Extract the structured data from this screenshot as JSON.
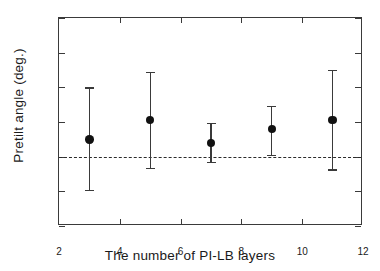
{
  "chart_data": {
    "type": "scatter",
    "title": "",
    "xlabel": "The number of PI-LB layers",
    "ylabel": "Pretilt angle (deg.)",
    "xlim": [
      2,
      12
    ],
    "ylim": [
      -0.2,
      0.4
    ],
    "xticks": [
      "2",
      "4",
      "6",
      "8",
      "10",
      "12"
    ],
    "xtick_values": [
      2,
      4,
      6,
      8,
      10,
      12
    ],
    "yticks": [
      "0.4",
      "0.3",
      "0.2",
      "0.1",
      "0.0",
      "-0.1",
      "-0.2"
    ],
    "ytick_values": [
      0.4,
      0.3,
      0.2,
      0.1,
      0.0,
      -0.1,
      -0.2
    ],
    "grid": false,
    "legend": "none",
    "x": [
      3,
      5,
      7,
      9,
      11
    ],
    "values": [
      0.05,
      0.105,
      0.04,
      0.08,
      0.105
    ],
    "yerr_upper": [
      0.2,
      0.245,
      0.098,
      0.147,
      0.25
    ],
    "yerr_lower": [
      -0.095,
      -0.032,
      -0.015,
      0.005,
      -0.037
    ],
    "annotations": [
      {
        "type": "hline",
        "y": 0.0,
        "style": "dashed",
        "label": "zero reference"
      }
    ],
    "marker": "filled-circle",
    "marker_color": "#111111",
    "error_color": "#3a3a3a",
    "axis_color": "#3a3a3a"
  },
  "axes": {
    "y_title": "Pretilt angle (deg.)",
    "x_title": "The number of PI-LB layers"
  }
}
